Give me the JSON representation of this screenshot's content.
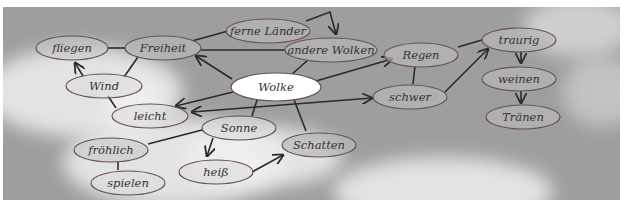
{
  "diagram": {
    "type": "mind-map",
    "background": "cloudy-sky-photo",
    "colors": {
      "sky": "#9e9e9e",
      "cloud": "#f0f0f0",
      "node_fill": "#c8c8c8",
      "node_stroke": "#6a4e58",
      "center_fill": "#ffffff",
      "edge": "#2a2a2a",
      "text": "#333333"
    },
    "nodes": [
      {
        "id": "wolke",
        "label": "Wolke",
        "center": true
      },
      {
        "id": "fliegen",
        "label": "fliegen"
      },
      {
        "id": "freiheit",
        "label": "Freiheit"
      },
      {
        "id": "ferne",
        "label": "ferne Länder"
      },
      {
        "id": "andere",
        "label": "andere Wolken"
      },
      {
        "id": "wind",
        "label": "Wind"
      },
      {
        "id": "leicht",
        "label": "leicht"
      },
      {
        "id": "sonne",
        "label": "Sonne"
      },
      {
        "id": "froehlich",
        "label": "fröhlich"
      },
      {
        "id": "spielen",
        "label": "spielen"
      },
      {
        "id": "heiss",
        "label": "heiß"
      },
      {
        "id": "schatten",
        "label": "Schatten"
      },
      {
        "id": "regen",
        "label": "Regen"
      },
      {
        "id": "schwer",
        "label": "schwer"
      },
      {
        "id": "traurig",
        "label": "traurig"
      },
      {
        "id": "weinen",
        "label": "weinen"
      },
      {
        "id": "traenen",
        "label": "Tränen"
      }
    ],
    "edges": [
      {
        "from": "fliegen",
        "to": "freiheit",
        "arrow": false
      },
      {
        "from": "freiheit",
        "to": "ferne",
        "arrow": false
      },
      {
        "from": "freiheit",
        "to": "andere",
        "arrow": false
      },
      {
        "from": "ferne",
        "to": "andere",
        "arrow": true
      },
      {
        "from": "wolke",
        "to": "freiheit",
        "arrow": true
      },
      {
        "from": "wolke",
        "to": "andere",
        "arrow": false
      },
      {
        "from": "wind",
        "to": "fliegen",
        "arrow": true
      },
      {
        "from": "wind",
        "to": "freiheit",
        "arrow": false
      },
      {
        "from": "wind",
        "to": "leicht",
        "arrow": false
      },
      {
        "from": "wolke",
        "to": "leicht",
        "arrow": true
      },
      {
        "from": "schwer",
        "to": "leicht",
        "arrow": true,
        "bidirectional": true
      },
      {
        "from": "wolke",
        "to": "sonne",
        "arrow": false
      },
      {
        "from": "wolke",
        "to": "schatten",
        "arrow": false
      },
      {
        "from": "wolke",
        "to": "regen",
        "arrow": true
      },
      {
        "from": "regen",
        "to": "schwer",
        "arrow": false
      },
      {
        "from": "regen",
        "to": "traurig",
        "arrow": false
      },
      {
        "from": "schwer",
        "to": "traurig",
        "arrow": true
      },
      {
        "from": "traurig",
        "to": "weinen",
        "arrow": true
      },
      {
        "from": "weinen",
        "to": "traenen",
        "arrow": true
      },
      {
        "from": "sonne",
        "to": "froehlich",
        "arrow": false
      },
      {
        "from": "sonne",
        "to": "heiss",
        "arrow": true
      },
      {
        "from": "heiss",
        "to": "schatten",
        "arrow": true
      },
      {
        "from": "froehlich",
        "to": "spielen",
        "arrow": false
      }
    ]
  }
}
